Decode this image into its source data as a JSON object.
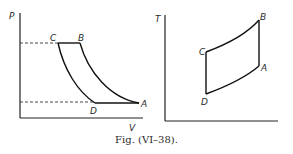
{
  "figure": {
    "caption": "Fig. (VI–38).",
    "left_diagram": {
      "y_axis_label": "P",
      "x_axis_label": "V",
      "points": {
        "A": "A",
        "B": "B",
        "C": "C",
        "D": "D"
      }
    },
    "right_diagram": {
      "y_axis_label": "T",
      "x_axis_label": "",
      "points": {
        "A": "A",
        "B": "B",
        "C": "C",
        "D": "D"
      }
    }
  }
}
